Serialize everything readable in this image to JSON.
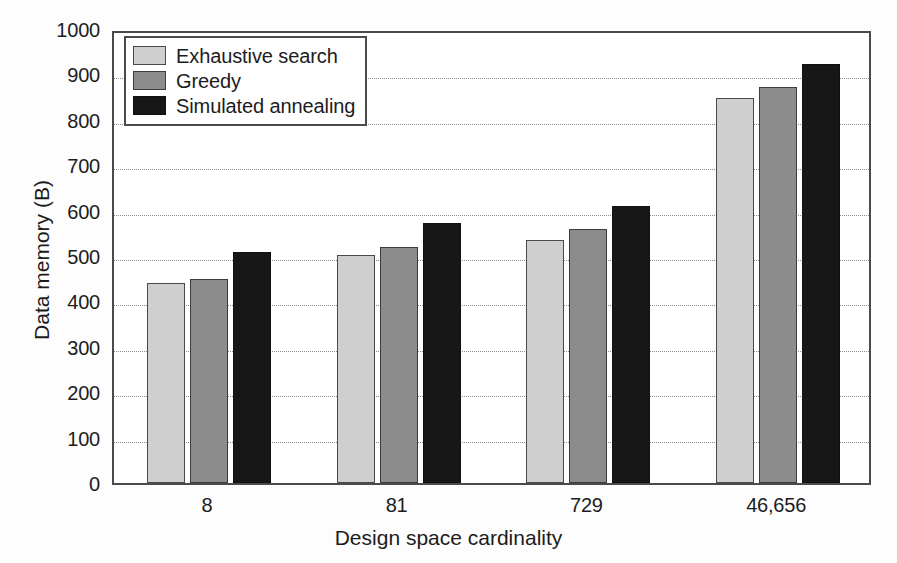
{
  "chart_data": {
    "type": "bar",
    "title": "",
    "xlabel": "Design space cardinality",
    "ylabel": "Data memory (B)",
    "categories": [
      "8",
      "81",
      "729",
      "46,656"
    ],
    "series": [
      {
        "name": "Exhaustive search",
        "color": "#cfcfcf",
        "values": [
          440,
          503,
          536,
          849
        ]
      },
      {
        "name": "Greedy",
        "color": "#8c8c8c",
        "values": [
          450,
          519,
          560,
          872
        ]
      },
      {
        "name": "Simulated annealing",
        "color": "#171717",
        "values": [
          508,
          573,
          611,
          923
        ]
      }
    ],
    "ylim": [
      0,
      1000
    ],
    "y_ticks": [
      0,
      100,
      200,
      300,
      400,
      500,
      600,
      700,
      800,
      900,
      1000
    ],
    "y_tick_labels": [
      "0",
      "100",
      "200",
      "300",
      "400",
      "500",
      "600",
      "700",
      "800",
      "900",
      "1000"
    ],
    "grid": "horizontal-dotted",
    "legend_position": "top-left"
  },
  "axes": {
    "y_title": "Data memory (B)",
    "x_title": "Design space cardinality"
  },
  "legend": {
    "items": [
      {
        "label": "Exhaustive search"
      },
      {
        "label": "Greedy"
      },
      {
        "label": "Simulated annealing"
      }
    ]
  },
  "colors": {
    "series_1": "#cfcfcf",
    "series_2": "#8c8c8c",
    "series_3": "#171717",
    "frame": "#4a4a4a",
    "grid": "#8d8d8d",
    "background": "#fdfdfd"
  }
}
